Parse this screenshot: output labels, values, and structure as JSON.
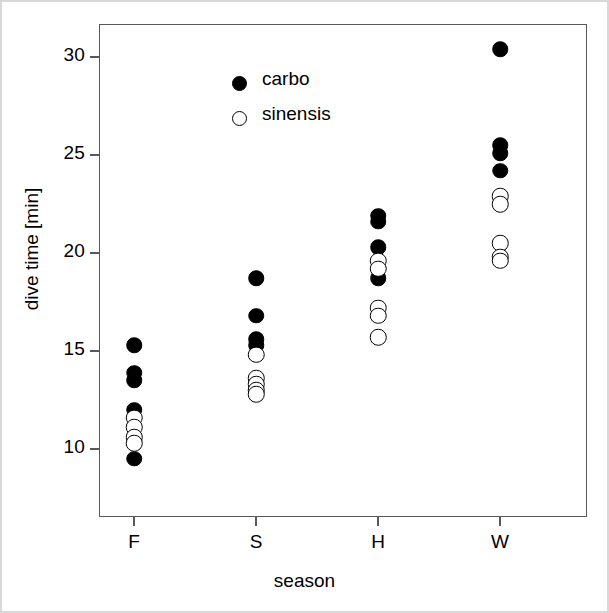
{
  "chart_data": {
    "type": "scatter",
    "title": "",
    "xlabel": "season",
    "ylabel": "dive time [min]",
    "categories": [
      "F",
      "S",
      "H",
      "W"
    ],
    "xtick_labels": [
      "F",
      "S",
      "H",
      "W"
    ],
    "ytick_labels": [
      "10",
      "15",
      "20",
      "25",
      "30"
    ],
    "ytick_values": [
      10,
      15,
      20,
      25,
      30
    ],
    "ylim": [
      9.0,
      31.2
    ],
    "grid": false,
    "legend_position": "top-left",
    "legend_entries": [
      {
        "name": "carbo",
        "marker": "filled-circle"
      },
      {
        "name": "sinensis",
        "marker": "open-circle"
      }
    ],
    "series": [
      {
        "name": "carbo",
        "marker": "filled-circle",
        "points": [
          {
            "category": "F",
            "value": 15.3
          },
          {
            "category": "F",
            "value": 13.9
          },
          {
            "category": "F",
            "value": 13.5
          },
          {
            "category": "F",
            "value": 12.0
          },
          {
            "category": "F",
            "value": 9.5
          },
          {
            "category": "S",
            "value": 18.7
          },
          {
            "category": "S",
            "value": 16.8
          },
          {
            "category": "S",
            "value": 15.6
          },
          {
            "category": "S",
            "value": 15.3
          },
          {
            "category": "H",
            "value": 21.9
          },
          {
            "category": "H",
            "value": 21.6
          },
          {
            "category": "H",
            "value": 20.3
          },
          {
            "category": "H",
            "value": 18.7
          },
          {
            "category": "W",
            "value": 30.4
          },
          {
            "category": "W",
            "value": 25.5
          },
          {
            "category": "W",
            "value": 25.1
          },
          {
            "category": "W",
            "value": 24.2
          }
        ]
      },
      {
        "name": "sinensis",
        "marker": "open-circle",
        "points": [
          {
            "category": "F",
            "value": 11.6
          },
          {
            "category": "F",
            "value": 11.1
          },
          {
            "category": "F",
            "value": 10.6
          },
          {
            "category": "F",
            "value": 10.3
          },
          {
            "category": "S",
            "value": 14.8
          },
          {
            "category": "S",
            "value": 13.6
          },
          {
            "category": "S",
            "value": 13.3
          },
          {
            "category": "S",
            "value": 13.0
          },
          {
            "category": "S",
            "value": 12.8
          },
          {
            "category": "H",
            "value": 19.6
          },
          {
            "category": "H",
            "value": 19.2
          },
          {
            "category": "H",
            "value": 17.2
          },
          {
            "category": "H",
            "value": 16.8
          },
          {
            "category": "H",
            "value": 15.7
          },
          {
            "category": "W",
            "value": 22.9
          },
          {
            "category": "W",
            "value": 22.5
          },
          {
            "category": "W",
            "value": 20.5
          },
          {
            "category": "W",
            "value": 19.8
          },
          {
            "category": "W",
            "value": 19.6
          }
        ]
      }
    ]
  }
}
